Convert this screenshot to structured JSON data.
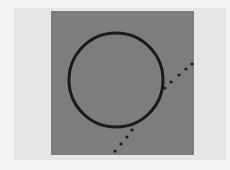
{
  "scene": {
    "description": "Gray square with black circle and dotted diagonal line",
    "colors": {
      "background": "#f4f4f4",
      "paper": "#e6e6e6",
      "square": "#7d7d7d",
      "stroke": "#1a1a1a"
    },
    "circle": {
      "cx": 116,
      "cy": 80,
      "r": 47,
      "stroke_width": 3
    },
    "dotted_line": {
      "points": [
        [
          115,
          151
        ],
        [
          121,
          144
        ],
        [
          127,
          137
        ],
        [
          132,
          130
        ],
        [
          165,
          88
        ],
        [
          171,
          82
        ],
        [
          179,
          75
        ],
        [
          186,
          69
        ],
        [
          192,
          64
        ]
      ]
    }
  }
}
